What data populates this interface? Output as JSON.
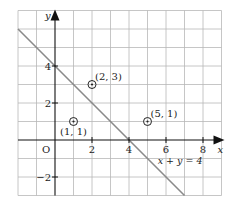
{
  "chart_data": {
    "type": "scatter",
    "title": "",
    "xlabel": "x",
    "ylabel": "y",
    "xlim": [
      -2,
      9
    ],
    "ylim": [
      -3,
      7
    ],
    "grid": true,
    "origin_label": "O",
    "x_ticks": [
      2,
      4,
      6,
      8
    ],
    "y_ticks": [
      -2,
      2,
      4
    ],
    "x_tick_labels": [
      "2",
      "4",
      "6",
      "8"
    ],
    "y_tick_labels": [
      "−2",
      "2",
      "4"
    ],
    "line": {
      "label": "x + y = 4",
      "equation": "x + y = 4",
      "points": [
        [
          -2,
          6
        ],
        [
          7,
          -3
        ]
      ]
    },
    "points": [
      {
        "x": 1,
        "y": 1,
        "label": "(1, 1)"
      },
      {
        "x": 2,
        "y": 3,
        "label": "(2, 3)"
      },
      {
        "x": 5,
        "y": 1,
        "label": "(5, 1)"
      }
    ],
    "colors": {
      "grid": "#b8b8b8",
      "axis": "#111111",
      "line": "#8a8a8a",
      "point": "#222222"
    }
  }
}
